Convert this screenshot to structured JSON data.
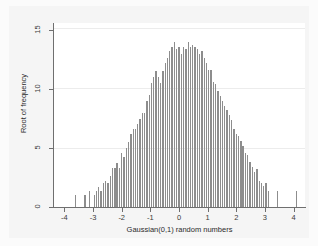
{
  "chart_data": {
    "type": "bar",
    "title": "",
    "subtitle": "",
    "xlabel": "Gaussian(0,1) random numbers",
    "ylabel": "Root of frequency",
    "xlim": [
      -4.4,
      4.4
    ],
    "ylim": [
      0,
      15.6
    ],
    "xticks": [
      -4,
      -3,
      -2,
      -1,
      0,
      1,
      2,
      3,
      4
    ],
    "xtick_labels": [
      "-4",
      "-3",
      "-2",
      "-1",
      "0",
      "1",
      "2",
      "3",
      "4"
    ],
    "yticks": [
      0,
      5,
      10,
      15
    ],
    "ytick_labels": [
      "0",
      "5",
      "10",
      "15"
    ],
    "grid": "horizontal-faint",
    "legend": "none",
    "bar_color": "#8d8d8d",
    "plot_bg": "#ffffff",
    "figure_bg": "#f5f5f5",
    "axis_color": "#6f6f6f",
    "note": "Spike plot of root of frequency vs value; x = bin centre, y = sqrt(frequency)",
    "x": [
      -3.62,
      -3.28,
      -3.12,
      -2.96,
      -2.88,
      -2.8,
      -2.72,
      -2.64,
      -2.56,
      -2.48,
      -2.4,
      -2.32,
      -2.24,
      -2.16,
      -2.08,
      -2.0,
      -1.92,
      -1.84,
      -1.76,
      -1.68,
      -1.6,
      -1.52,
      -1.44,
      -1.36,
      -1.28,
      -1.2,
      -1.12,
      -1.04,
      -0.96,
      -0.88,
      -0.8,
      -0.72,
      -0.64,
      -0.56,
      -0.48,
      -0.4,
      -0.32,
      -0.24,
      -0.16,
      -0.08,
      0.0,
      0.08,
      0.16,
      0.24,
      0.32,
      0.4,
      0.48,
      0.56,
      0.64,
      0.72,
      0.8,
      0.88,
      0.96,
      1.04,
      1.12,
      1.2,
      1.28,
      1.36,
      1.44,
      1.52,
      1.6,
      1.68,
      1.76,
      1.84,
      1.92,
      2.0,
      2.08,
      2.16,
      2.24,
      2.32,
      2.4,
      2.48,
      2.56,
      2.64,
      2.72,
      2.8,
      2.88,
      2.96,
      3.04,
      3.12,
      3.44,
      4.1
    ],
    "values": [
      1.0,
      1.0,
      1.4,
      1.0,
      1.4,
      1.7,
      1.4,
      2.0,
      2.2,
      2.0,
      2.6,
      3.3,
      3.3,
      3.7,
      3.3,
      4.6,
      4.2,
      5.0,
      5.5,
      6.2,
      6.6,
      6.6,
      7.0,
      7.5,
      8.0,
      8.0,
      9.0,
      9.5,
      10.5,
      11.0,
      11.5,
      11.0,
      10.5,
      11.5,
      12.2,
      12.6,
      13.2,
      13.6,
      14.0,
      13.4,
      13.6,
      13.0,
      13.6,
      13.4,
      14.0,
      13.6,
      13.7,
      13.6,
      13.4,
      13.0,
      13.2,
      12.6,
      12.2,
      11.6,
      11.6,
      10.6,
      10.4,
      9.8,
      9.4,
      9.0,
      8.6,
      8.2,
      7.8,
      7.4,
      6.6,
      6.2,
      6.0,
      5.6,
      5.2,
      4.6,
      4.4,
      3.8,
      3.4,
      3.0,
      3.2,
      2.2,
      2.0,
      1.8,
      2.0,
      1.4,
      1.4,
      1.4
    ]
  }
}
